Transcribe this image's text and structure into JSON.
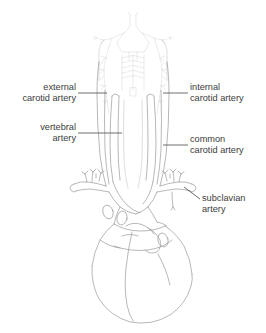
{
  "figure": {
    "background_color": "#ffffff",
    "line_color": "#9a9a9a",
    "leader_color": "#4a4a4a",
    "text_color": "#3c3c3c"
  },
  "labels": {
    "external_carotid": {
      "line1": "external",
      "line2": "carotid artery"
    },
    "vertebral": {
      "line1": "vertebral",
      "line2": "artery"
    },
    "internal_carotid": {
      "line1": "internal",
      "line2": "carotid artery"
    },
    "common_carotid": {
      "line1": "common",
      "line2": "carotid artery"
    },
    "subclavian": {
      "line1": "subclavian",
      "line2": "artery"
    }
  }
}
